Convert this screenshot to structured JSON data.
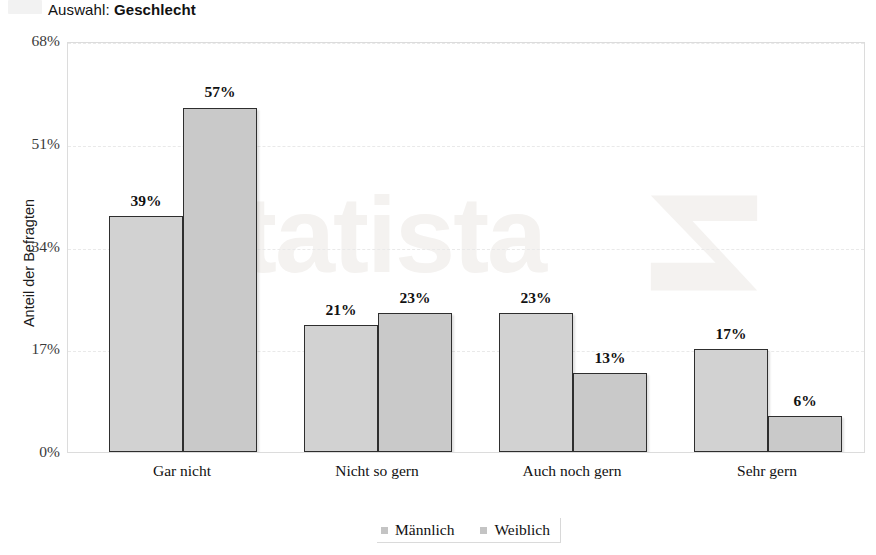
{
  "title": {
    "prefix": "Auswahl: ",
    "emphasis": "Geschlecht"
  },
  "watermark": {
    "text": "statista",
    "mark_name": "statista-logo-mark"
  },
  "legend": {
    "position": "bottom-center",
    "items": [
      {
        "label": "Männlich",
        "color": "#d2d2d2"
      },
      {
        "label": "Weiblich",
        "color": "#c9c9c9"
      }
    ]
  },
  "chart_data": {
    "type": "bar",
    "title": "Auswahl: Geschlecht",
    "xlabel": "",
    "ylabel": "Anteil der Befragten",
    "categories": [
      "Gar nicht",
      "Nicht so gern",
      "Auch noch gern",
      "Sehr gern"
    ],
    "series": [
      {
        "name": "Männlich",
        "color": "#d2d2d2",
        "values": [
          39,
          21,
          23,
          17
        ],
        "labels": [
          "39%",
          "21%",
          "23%",
          "17%"
        ]
      },
      {
        "name": "Weiblich",
        "color": "#c9c9c9",
        "values": [
          57,
          23,
          13,
          6
        ],
        "labels": [
          "57%",
          "23%",
          "13%",
          "6%"
        ]
      }
    ],
    "ylim": [
      0,
      68
    ],
    "yticks": [
      0,
      17,
      34,
      51,
      68
    ],
    "ytick_labels": [
      "0%",
      "17%",
      "34%",
      "51%",
      "68%"
    ],
    "grid": true,
    "value_labels_shown": true,
    "unit": "%"
  }
}
